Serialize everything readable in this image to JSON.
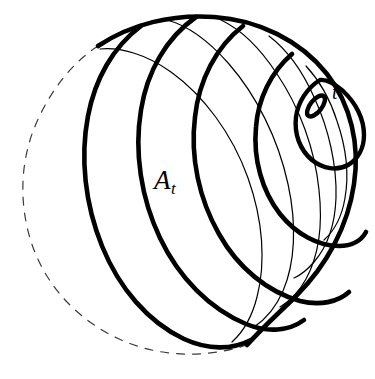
{
  "figure": {
    "kind": "mathematical-diagram",
    "background_color": "#ffffff",
    "ink_color": "#000000",
    "width": 375,
    "height": 379
  },
  "labels": {
    "region_label": {
      "base": "A",
      "subscript": "t",
      "full": "A_t",
      "role": "region-label"
    },
    "point_label": {
      "text": "t",
      "role": "point-label"
    }
  },
  "geometry": {
    "sphere_outline": {
      "name": "sphere-silhouette",
      "center_x": 186,
      "center_y": 192,
      "radius_x": 163,
      "radius_y": 168,
      "hidden_arc_style": "dashed",
      "visible_arc_style": "solid-thick",
      "dash_pattern": "7 7",
      "hidden_stroke_width": 1.1,
      "visible_stroke_width": 4.6
    },
    "curve_family": {
      "name": "nested-level-curves",
      "description": "family of closed curves on the sphere shrinking toward the point t",
      "thick_stroke_width": 4.6,
      "thin_stroke_width": 1.1,
      "count_thick": 5,
      "count_thin": 5
    },
    "focus_point": {
      "name": "degenerate-loop-at-t",
      "cx": 316,
      "cy": 106,
      "rx": 12,
      "ry": 5.5,
      "rotation_deg": -52,
      "stroke_width": 4.4
    }
  }
}
